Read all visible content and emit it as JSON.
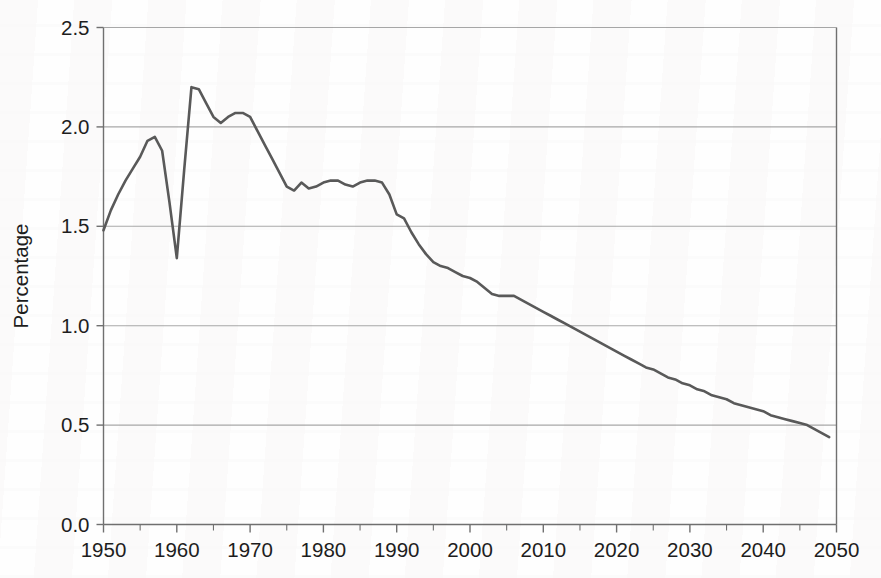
{
  "chart_data": {
    "type": "line",
    "title": "",
    "xlabel": "",
    "ylabel": "Percentage",
    "xlim": [
      1950,
      2050
    ],
    "ylim": [
      0.0,
      2.5
    ],
    "grid": "horizontal",
    "legend": "none",
    "y_ticks": [
      "0.0",
      "0.5",
      "1.0",
      "1.5",
      "2.0",
      "2.5"
    ],
    "y_tick_values": [
      0.0,
      0.5,
      1.0,
      1.5,
      2.0,
      2.5
    ],
    "x_ticks": [
      "1950",
      "1960",
      "1970",
      "1980",
      "1990",
      "2000",
      "2010",
      "2020",
      "2030",
      "2040",
      "2050"
    ],
    "x_tick_values": [
      1950,
      1960,
      1970,
      1980,
      1990,
      2000,
      2010,
      2020,
      2030,
      2040,
      2050
    ],
    "x_minor_tick_values": [
      1955,
      1965,
      1975,
      1985,
      1995,
      2005,
      2015,
      2025,
      2035,
      2045
    ],
    "line_color": "#595959",
    "grid_color": "#a8a8a8",
    "axis_color": "#707070",
    "series": [
      {
        "name": "Percentage",
        "x": [
          1950,
          1951,
          1952,
          1953,
          1954,
          1955,
          1956,
          1957,
          1958,
          1959,
          1960,
          1961,
          1962,
          1963,
          1964,
          1965,
          1966,
          1967,
          1968,
          1969,
          1970,
          1971,
          1972,
          1973,
          1974,
          1975,
          1976,
          1977,
          1978,
          1979,
          1980,
          1981,
          1982,
          1983,
          1984,
          1985,
          1986,
          1987,
          1988,
          1989,
          1990,
          1991,
          1992,
          1993,
          1994,
          1995,
          1996,
          1997,
          1998,
          1999,
          2000,
          2001,
          2002,
          2003,
          2004,
          2005,
          2006,
          2007,
          2008,
          2009,
          2010,
          2011,
          2012,
          2013,
          2014,
          2015,
          2016,
          2017,
          2018,
          2019,
          2020,
          2021,
          2022,
          2023,
          2024,
          2025,
          2026,
          2027,
          2028,
          2029,
          2030,
          2031,
          2032,
          2033,
          2034,
          2035,
          2036,
          2037,
          2038,
          2039,
          2040,
          2041,
          2042,
          2043,
          2044,
          2045,
          2046,
          2047,
          2048,
          2049
        ],
        "y": [
          1.48,
          1.58,
          1.66,
          1.73,
          1.79,
          1.85,
          1.93,
          1.95,
          1.88,
          1.62,
          1.34,
          1.78,
          2.2,
          2.19,
          2.12,
          2.05,
          2.02,
          2.05,
          2.07,
          2.07,
          2.05,
          1.98,
          1.91,
          1.84,
          1.77,
          1.7,
          1.68,
          1.72,
          1.69,
          1.7,
          1.72,
          1.73,
          1.73,
          1.71,
          1.7,
          1.72,
          1.73,
          1.73,
          1.72,
          1.66,
          1.56,
          1.54,
          1.47,
          1.41,
          1.36,
          1.32,
          1.3,
          1.29,
          1.27,
          1.25,
          1.24,
          1.22,
          1.19,
          1.16,
          1.15,
          1.15,
          1.15,
          1.13,
          1.11,
          1.09,
          1.07,
          1.05,
          1.03,
          1.01,
          0.99,
          0.97,
          0.95,
          0.93,
          0.91,
          0.89,
          0.87,
          0.85,
          0.83,
          0.81,
          0.79,
          0.78,
          0.76,
          0.74,
          0.73,
          0.71,
          0.7,
          0.68,
          0.67,
          0.65,
          0.64,
          0.63,
          0.61,
          0.6,
          0.59,
          0.58,
          0.57,
          0.55,
          0.54,
          0.53,
          0.52,
          0.51,
          0.5,
          0.48,
          0.46,
          0.44
        ]
      }
    ]
  }
}
